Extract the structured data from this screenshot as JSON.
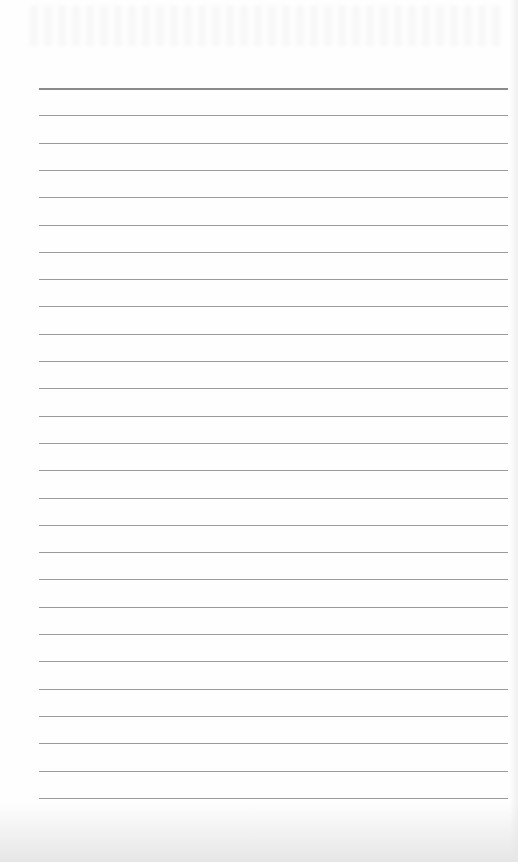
{
  "document": {
    "type": "lined paper",
    "line_count": 27,
    "first_line_y": 88,
    "line_spacing": 27.3,
    "line_left": 39,
    "line_right": 508,
    "colors": {
      "paper": "#fefefe",
      "rule": "#9a9a9a",
      "header_rule": "#8a8a8a"
    }
  }
}
